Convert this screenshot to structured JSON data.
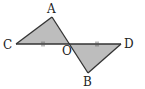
{
  "diagram": {
    "type": "geometry",
    "points": {
      "A": {
        "label": "A",
        "x": 52,
        "y": 17,
        "lx": 47,
        "ly": 13
      },
      "B": {
        "label": "B",
        "x": 88,
        "y": 73,
        "lx": 83,
        "ly": 86
      },
      "C": {
        "label": "C",
        "x": 16,
        "y": 44,
        "lx": 3,
        "ly": 49
      },
      "D": {
        "label": "D",
        "x": 121,
        "y": 44,
        "lx": 124,
        "ly": 48
      },
      "O": {
        "label": "O",
        "x": 69,
        "y": 44,
        "lx": 62,
        "ly": 55
      }
    },
    "triangles": [
      {
        "name": "triangle-AOC",
        "vertices": [
          "A",
          "O",
          "C"
        ],
        "fill": "#bdbdbd"
      },
      {
        "name": "triangle-BOD",
        "vertices": [
          "B",
          "O",
          "D"
        ],
        "fill": "#bdbdbd"
      }
    ],
    "equal_marks": [
      {
        "segment": "CO",
        "marks": 2
      },
      {
        "segment": "OD",
        "marks": 2
      }
    ]
  }
}
